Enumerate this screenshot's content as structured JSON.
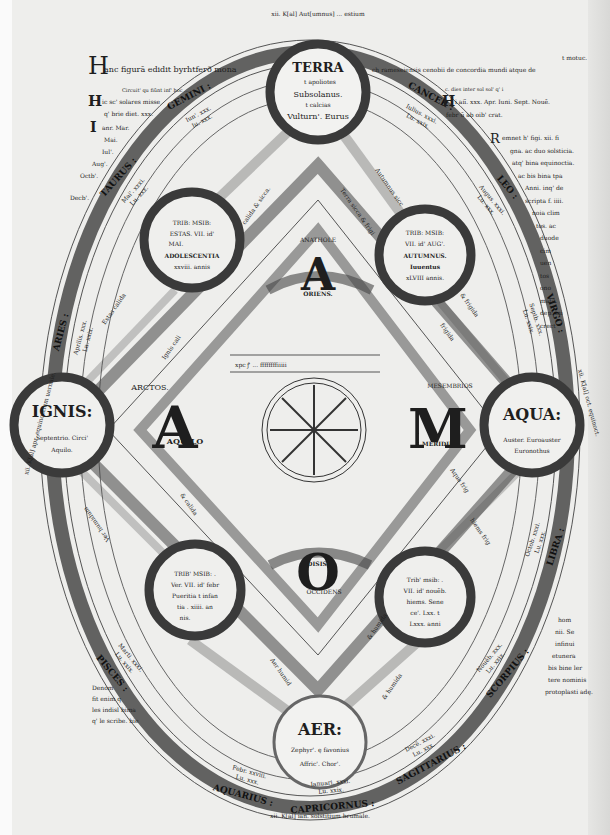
{
  "header": {
    "title_initial": "H",
    "title_text": "anc figurā edidit byrhtferð mona",
    "title_right": "ch rameseiensis cenobii de concordia mundi atque de",
    "corner_note": "t motuc."
  },
  "top_arc_label": "xii. K[al] Aut[umnus] ... estium",
  "elements": {
    "terra": {
      "name": "TERRA",
      "lines": [
        "t apoliotes",
        "Subsolanus.",
        "t calcias",
        "Vulturn'. Eurus"
      ]
    },
    "ignis": {
      "name": "IGNIS:",
      "lines": [
        "Septentrio. Circi'",
        "Aquilo."
      ]
    },
    "aqua": {
      "name": "AQUA:",
      "lines": [
        "Auster. Euroauster",
        "Euronothus"
      ]
    },
    "aer": {
      "name": "AER:",
      "lines": [
        "Zephyr'. ę favonius",
        "Affric'. Chor'."
      ]
    }
  },
  "seasons": {
    "summer": {
      "lines": [
        "TRIB: MSIB:",
        "ESTAS. VII. id'",
        "MAI.",
        "ADOLESCENTIA",
        "xxviii. annis"
      ]
    },
    "autumn": {
      "lines": [
        "TRIB: MSIB:",
        "VII. id' AUG'.",
        "AUTUMNUS.",
        "Iuuentus",
        "xLVIII annis."
      ]
    },
    "spring": {
      "lines": [
        "TRIB' MSIB: .",
        "Ver. VII. id' febr",
        "Pueritia t infan",
        "tia . xiiii. an",
        "nis."
      ]
    },
    "winter": {
      "lines": [
        "Trib' msib: .",
        "VII. id' nouēb.",
        "hiems. Sene",
        "ce'. Lxx. t",
        "Lxxx. anni"
      ]
    }
  },
  "cardinal": {
    "arctos": "ARCTOS.",
    "aquilo": "AQUILO",
    "mesembrios": "MESEMBRIOS",
    "meridies": "MERIDIES",
    "anatole": "ANATHOLE",
    "oriens": "ORIENS.",
    "disis": "DISIS.",
    "occidens": "OCCIDENS",
    "letter_a_top": "A",
    "letter_a_left": "A",
    "letter_m": "M",
    "letter_o": "O"
  },
  "qualities": {
    "terra_sicca": "Terra sicca & frigi",
    "calida_sicca": "calida & sicca.",
    "autumnus_sicca": "Autumnus sicc",
    "frigida": "frigida",
    "frigida2": "& frigida",
    "aestas_calida": "Estas calida",
    "ignis_cali": "Ignis cali",
    "aqua_frig": "Aqua frig",
    "hiems_frig": "hiems frig",
    "ver_humidum": "Ver humidum",
    "humida": "& humida",
    "aer_humid": "Aer humid",
    "calida_humida": "& calida",
    "humida2": "& humida"
  },
  "zodiac": [
    {
      "sign": "GEMINI",
      "note": [
        "Iun'. xxx.",
        "Iu. xxx."
      ]
    },
    {
      "sign": "CANCER",
      "note": [
        "Iulius. xxxi.",
        "Lu. xxix."
      ]
    },
    {
      "sign": "LEO",
      "note": [
        "Augus. xxxi.",
        "Lu. xxx."
      ]
    },
    {
      "sign": "VIRGO",
      "note": [
        "Septb. xxx.",
        "Lu. xxix."
      ]
    },
    {
      "sign": "LIBRA",
      "note": [
        "Octob. xxxi.",
        "Lu. xxx."
      ]
    },
    {
      "sign": "SCORPIUS",
      "note": [
        "Nouēb. xxx.",
        "Lu. xxix."
      ]
    },
    {
      "sign": "SAGITTARIUS",
      "note": [
        "Decē. xxxi.",
        "Lu. xxx."
      ]
    },
    {
      "sign": "CAPRICORNUS",
      "note": [
        "Ianuari. xxxi.",
        "Lu. xxix."
      ]
    },
    {
      "sign": "AQUARIUS",
      "note": [
        "Febr. xxviii.",
        "Lu. xxx."
      ]
    },
    {
      "sign": "PISCES",
      "note": [
        "Marti. xxxi.",
        "Lu. xxix."
      ]
    },
    {
      "sign": "ARIES",
      "note": [
        "Aprilis. xxx.",
        "Lu. xxix."
      ]
    },
    {
      "sign": "TAURUS",
      "note": [
        "Mai'. xxxi.",
        "Lu. xxx."
      ]
    }
  ],
  "equinox_labels": {
    "left": "xii. K[al] apr. equinoctium uernale.",
    "right": "xii. K[al] oct. equinoct.",
    "bottom": "xii. K[al] ian. solstitium brumale."
  },
  "left_notes": {
    "note1_small": "Circuit' qu fiūnt inf' hoc ...",
    "note1_initial": "H",
    "note1": [
      "ic sc' solares misse",
      "q' brie diet. xxx."
    ],
    "note2_initial": "I",
    "note2": [
      "anr. Mar.",
      "Mai.",
      "Iul'.",
      "Aug'.",
      "Octb'.",
      "Decb'."
    ]
  },
  "right_notes": {
    "note1_small": "c. dies inter sol sol' q' i",
    "note1_initial": "H",
    "note1": [
      "i aiī. xxx. Apr. Iuni. Sept. Nouē.",
      "febr ū ab oib' crat."
    ],
    "note2_initial": "R",
    "note2": [
      "emnet h' figi. xii. fi",
      "gna. ac duo solsticia.",
      "atq' bina equinoctia.",
      "ac bis bina tpa",
      "Anni. inq' de",
      "scripta f. iiii.",
      "noia clim",
      "tos. ac",
      "duode",
      "cim",
      "uen",
      "tos",
      "ono",
      "mata.",
      "dep. ini",
      "crect"
    ],
    "note3": [
      "hom",
      "nii. Se",
      "infinui",
      "etunera",
      "bis bine ler",
      "tere nominis",
      "protoplasti adę."
    ]
  },
  "bottom_left_notes": [
    "Denom",
    "fit enim q",
    "les indisl bima",
    "q' le scribe. hie"
  ],
  "center": {
    "lunar_row": "xpc ꝭ ... ffffffffiiiii",
    "wheel_label": "rota"
  }
}
